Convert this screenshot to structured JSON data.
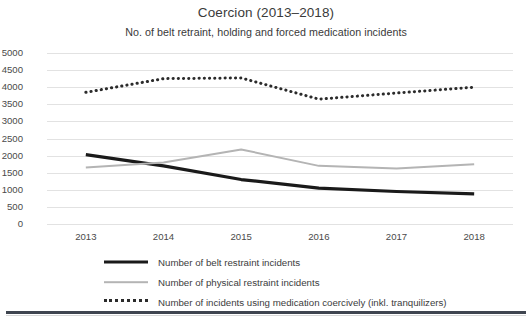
{
  "chart_data": {
    "type": "line",
    "title": "Coercion (2013–2018)",
    "subtitle": "No. of belt retraint, holding and forced medication incidents",
    "xlabel": "",
    "ylabel": "",
    "categories": [
      "2013",
      "2014",
      "2015",
      "2016",
      "2017",
      "2018"
    ],
    "x": [
      2013,
      2014,
      2015,
      2016,
      2017,
      2018
    ],
    "ylim": [
      0,
      5000
    ],
    "y_ticks": [
      "5000",
      "4500",
      "4000",
      "3500",
      "3000",
      "2500",
      "2000",
      "1500",
      "1000",
      "500",
      "0"
    ],
    "y_tick_values": [
      5000,
      4500,
      4000,
      3500,
      3000,
      2500,
      2000,
      1500,
      1000,
      500,
      0
    ],
    "grid": true,
    "legend_position": "bottom",
    "series": [
      {
        "name": "Number of belt restraint incidents",
        "style": "solid-thick",
        "color": "#1a1a1a",
        "values": [
          2030,
          1700,
          1300,
          1050,
          950,
          880
        ]
      },
      {
        "name": "Number of physical restraint incidents",
        "style": "solid-thin",
        "color": "#b4b4b4",
        "values": [
          1650,
          1800,
          2180,
          1700,
          1620,
          1750
        ]
      },
      {
        "name": "Number of incidents using medication coercively (inkl. tranquilizers)",
        "style": "dotted",
        "color": "#2b2b2b",
        "values": [
          3850,
          4250,
          4270,
          3650,
          3830,
          4000
        ]
      }
    ]
  },
  "legend": {
    "items": [
      {
        "label": "Number of belt restraint incidents",
        "swatch": "solid-black-line-icon"
      },
      {
        "label": "Number of physical restraint incidents",
        "swatch": "solid-gray-line-icon"
      },
      {
        "label": "Number of incidents using medication coercively (inkl. tranquilizers)",
        "swatch": "dotted-black-line-icon"
      }
    ]
  }
}
